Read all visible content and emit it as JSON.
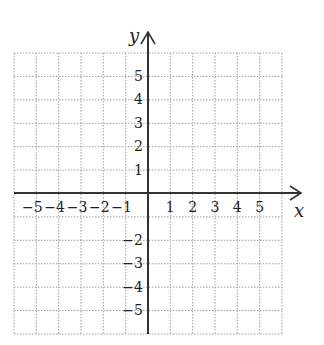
{
  "diagram": {
    "type": "coordinate-plane",
    "x_axis_label": "x",
    "y_axis_label": "y",
    "x_range": [
      -6,
      6
    ],
    "y_range": [
      -6,
      6
    ],
    "x_tick_labels": [
      "−5",
      "−4",
      "−3",
      "−2",
      "−1",
      "1",
      "2",
      "3",
      "4",
      "5"
    ],
    "y_tick_labels": [
      "5",
      "4",
      "3",
      "2",
      "1",
      "−2",
      "−3",
      "−4",
      "−5"
    ],
    "grid": "dotted",
    "colors": {
      "grid": "#9a9a9a",
      "axis": "#333333",
      "text": "#222222"
    }
  }
}
